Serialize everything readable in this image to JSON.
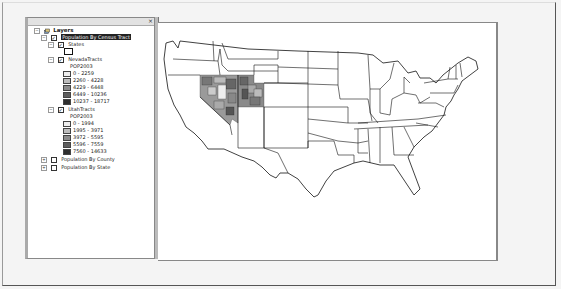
{
  "toc": {
    "close_glyph": "×",
    "root": {
      "label": "Layers",
      "icon": "layers-icon",
      "expanded": true
    },
    "groups": [
      {
        "label": "Population By Census Tract",
        "checked": true,
        "expanded": true,
        "selected": true,
        "layers": [
          {
            "label": "States",
            "checked": true,
            "expanded": true,
            "symbol": "hollow-polygon"
          },
          {
            "label": "NevadaTracts",
            "checked": true,
            "expanded": true,
            "field": "POP2003",
            "classes": [
              {
                "label": "0 - 2259",
                "color": "#eeeeee"
              },
              {
                "label": "2260 - 4228",
                "color": "#bdbdbd"
              },
              {
                "label": "4229 - 6448",
                "color": "#8c8c8c"
              },
              {
                "label": "6449 - 10236",
                "color": "#5e5e5e"
              },
              {
                "label": "10237 - 18717",
                "color": "#2e2e2e"
              }
            ]
          },
          {
            "label": "UtahTracts",
            "checked": true,
            "expanded": true,
            "field": "POP2003",
            "classes": [
              {
                "label": "0 - 1994",
                "color": "#eeeeee"
              },
              {
                "label": "1995 - 3971",
                "color": "#bdbdbd"
              },
              {
                "label": "3972 - 5595",
                "color": "#8c8c8c"
              },
              {
                "label": "5596 - 7559",
                "color": "#5e5e5e"
              },
              {
                "label": "7560 - 14633",
                "color": "#2e2e2e"
              }
            ]
          }
        ]
      },
      {
        "label": "Population By County",
        "checked": false,
        "expanded": false
      },
      {
        "label": "Population By State",
        "checked": false,
        "expanded": false
      }
    ],
    "expander_collapsed": "+",
    "expander_expanded": "−",
    "check_glyph": "✓"
  },
  "map": {
    "background": "#ffffff",
    "outline_color": "#111111",
    "highlight_states": [
      "Nevada",
      "Utah"
    ]
  }
}
